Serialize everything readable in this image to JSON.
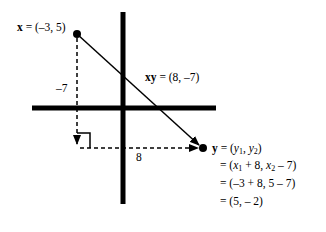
{
  "diagram": {
    "point_x": {
      "var": "x",
      "eq": " = ",
      "value": "(–3, 5)"
    },
    "vector_xy": {
      "var": "xy",
      "eq": " = ",
      "value": "(8, –7)"
    },
    "vertical_displacement": "–7",
    "horizontal_displacement": "8",
    "point_y": {
      "var": "y",
      "eq": " = ",
      "line1_open": "(",
      "y1": "y",
      "y1_sub": "1",
      "sep": ", ",
      "y2": "y",
      "y2_sub": "2",
      "line1_close": ")",
      "line2_prefix": "= (",
      "x1": "x",
      "x1_sub": "1",
      "line2_mid": " + 8,  ",
      "x2": "x",
      "x2_sub": "2",
      "line2_end": " – 7)",
      "line3": "= (–3 + 8,  5 – 7)",
      "line4": "= (5,  – 2)"
    }
  }
}
